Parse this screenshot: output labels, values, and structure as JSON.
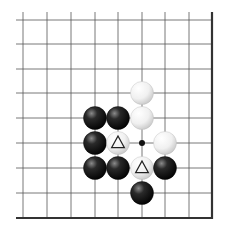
{
  "board": {
    "description": "Go problem diagram (lower-right corner region)",
    "grid_x": [
      23,
      47,
      71,
      95,
      118,
      142,
      165,
      189
    ],
    "grid_y": [
      20,
      44,
      69,
      93,
      118,
      143,
      168,
      193
    ],
    "right_edge_x": 212,
    "bottom_edge_y": 218,
    "line_start_x": 16,
    "line_start_y": 12,
    "line_color": "#555555",
    "edge_color": "#333333"
  },
  "stones": [
    {
      "color": "white",
      "x": 142,
      "y": 93,
      "mark": ""
    },
    {
      "color": "black",
      "x": 95,
      "y": 118,
      "mark": ""
    },
    {
      "color": "black",
      "x": 118,
      "y": 118,
      "mark": ""
    },
    {
      "color": "white",
      "x": 142,
      "y": 118,
      "mark": ""
    },
    {
      "color": "black",
      "x": 95,
      "y": 143,
      "mark": ""
    },
    {
      "color": "white",
      "x": 118,
      "y": 143,
      "mark": "triangle"
    },
    {
      "color": "white",
      "x": 165,
      "y": 143,
      "mark": ""
    },
    {
      "color": "black",
      "x": 95,
      "y": 168,
      "mark": ""
    },
    {
      "color": "black",
      "x": 118,
      "y": 168,
      "mark": ""
    },
    {
      "color": "white",
      "x": 142,
      "y": 168,
      "mark": "triangle"
    },
    {
      "color": "black",
      "x": 165,
      "y": 168,
      "mark": ""
    },
    {
      "color": "black",
      "x": 142,
      "y": 193,
      "mark": ""
    }
  ],
  "points": [
    {
      "type": "dot",
      "x": 142,
      "y": 143
    }
  ]
}
